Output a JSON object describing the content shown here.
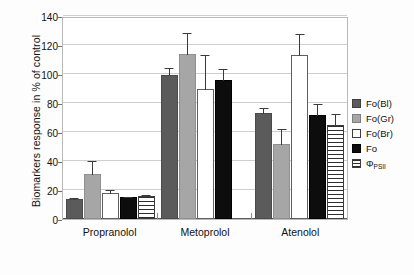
{
  "chart_data": {
    "type": "bar",
    "title": "",
    "xlabel": "",
    "ylabel": "Biomarkers response in % of control",
    "ylim": [
      0,
      140
    ],
    "yticks": [
      0,
      20,
      40,
      60,
      80,
      100,
      120,
      140
    ],
    "grid": true,
    "legend_position": "right",
    "categories": [
      "Propranolol",
      "Metoprolol",
      "Atenolol"
    ],
    "series": [
      {
        "name": "Fo(Bl)",
        "color": "#5b5b5b",
        "values": [
          14,
          99,
          73
        ],
        "errors": [
          1,
          6,
          4
        ]
      },
      {
        "name": "Fo(Gr)",
        "color": "#a6a6a6",
        "values": [
          31,
          114,
          52
        ],
        "errors": [
          10,
          15,
          11
        ]
      },
      {
        "name": "Fo(Br)",
        "color": "#ffffff",
        "values": [
          18,
          90,
          113
        ],
        "errors": [
          3,
          24,
          15
        ]
      },
      {
        "name": "Fo",
        "color": "#0d0d0d",
        "values": [
          15,
          96,
          72
        ],
        "errors": [
          1,
          8,
          8
        ]
      },
      {
        "name": "Φ PSII",
        "color": "#ffffff-striped",
        "values": [
          16,
          null,
          65
        ],
        "errors": [
          1,
          null,
          8
        ]
      }
    ]
  },
  "axis": {
    "y_title": "Biomarkers response in % of control",
    "tick_labels": [
      "0",
      "20",
      "40",
      "60",
      "80",
      "100",
      "120",
      "140"
    ],
    "category_labels": [
      "Propranolol",
      "Metoprolol",
      "Atenolol"
    ]
  },
  "legend": {
    "items": [
      {
        "label": "Fo(Bl)",
        "sub": ""
      },
      {
        "label": "Fo(Gr)",
        "sub": ""
      },
      {
        "label": "Fo(Br)",
        "sub": ""
      },
      {
        "label": "Fo",
        "sub": ""
      },
      {
        "label": "Φ",
        "sub": "PSII"
      }
    ]
  }
}
